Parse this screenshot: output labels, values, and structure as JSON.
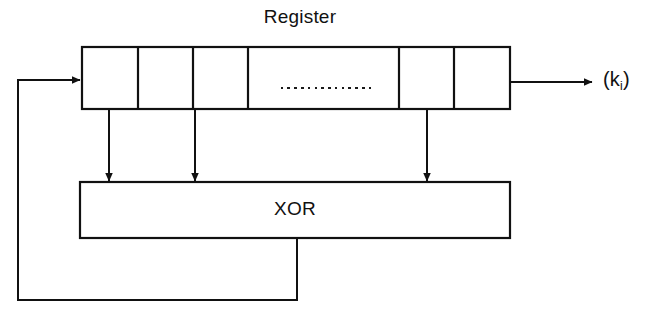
{
  "diagram": {
    "type": "block-diagram",
    "background_color": "#ffffff",
    "line_color": "#111111",
    "text_color": "#111111",
    "register": {
      "title": "Register",
      "cell_count": 6,
      "ellipsis_marker": "..............",
      "ellipsis_dot_count": 14,
      "cells": [
        {
          "index": 0,
          "label": ""
        },
        {
          "index": 1,
          "label": ""
        },
        {
          "index": 2,
          "label": ""
        },
        {
          "index": 3,
          "label": ""
        },
        {
          "index": 4,
          "label": ""
        },
        {
          "index": 5,
          "label": ""
        }
      ]
    },
    "xor": {
      "label": "XOR"
    },
    "output": {
      "label_main": "(k",
      "label_sub": "i",
      "label_close": ")",
      "full_label": "(k_i)"
    },
    "connections": [
      {
        "name": "feedback-into-register",
        "from": "xor-output-loop",
        "to": "register-cell-0",
        "arrow": true
      },
      {
        "name": "tap-cell-0-to-xor",
        "from": "register-cell-0",
        "to": "xor",
        "arrow": true
      },
      {
        "name": "tap-cell-2-to-xor",
        "from": "register-cell-2",
        "to": "xor",
        "arrow": true
      },
      {
        "name": "tap-cell-4-to-xor",
        "from": "register-cell-4",
        "to": "xor",
        "arrow": true
      },
      {
        "name": "register-to-keystream-output",
        "from": "register-cell-5",
        "to": "output-label",
        "arrow": true
      },
      {
        "name": "xor-to-feedback-loop",
        "from": "xor",
        "to": "feedback-loop",
        "arrow": false
      }
    ]
  }
}
